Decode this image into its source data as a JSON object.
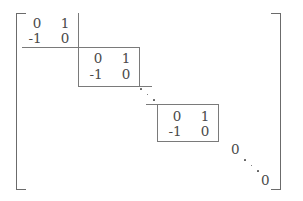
{
  "figure": {
    "kind": "block-diagonal-matrix",
    "bracket_left": "[",
    "bracket_right": "]"
  },
  "blocks": [
    {
      "name": "block-1",
      "rows": [
        [
          "0",
          "1"
        ],
        [
          "-1",
          "0"
        ]
      ]
    },
    {
      "name": "block-2",
      "rows": [
        [
          "0",
          "1"
        ],
        [
          "-1",
          "0"
        ]
      ]
    },
    {
      "name": "block-3",
      "rows": [
        [
          "0",
          "1"
        ],
        [
          "-1",
          "0"
        ]
      ]
    }
  ],
  "zeros": [
    {
      "name": "zero-upper",
      "value": "0"
    },
    {
      "name": "zero-lower",
      "value": "0"
    }
  ],
  "ellipses": [
    {
      "name": "ddots-between-block2-block3",
      "glyph": "ddots"
    },
    {
      "name": "ddots-lower-right",
      "glyph": "ddots"
    }
  ]
}
